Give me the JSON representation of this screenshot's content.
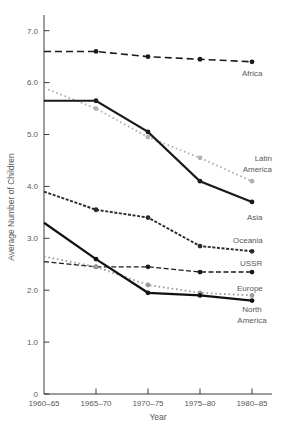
{
  "figure": {
    "background_color": "#ffffff",
    "axis_color": "#3c3c3c",
    "text_color": "#595959"
  },
  "chart_data": {
    "type": "line",
    "title": "",
    "xlabel": "Year",
    "ylabel": "Average Number of Children",
    "categories": [
      "1960–65",
      "1965–70",
      "1970–75",
      "1975–80",
      "1980–85"
    ],
    "y_ticks": [
      {
        "value": 7,
        "label": "7.0"
      },
      {
        "value": 6,
        "label": "6.0"
      },
      {
        "value": 5,
        "label": "5.0"
      },
      {
        "value": 4,
        "label": "4.0"
      },
      {
        "value": 3,
        "label": "3.0"
      },
      {
        "value": 2,
        "label": "2.0"
      },
      {
        "value": 1,
        "label": "1.0"
      },
      {
        "value": 0,
        "label": "0"
      }
    ],
    "ylim": [
      0,
      7.4
    ],
    "grid": false,
    "legend_position": "labels-at-line-ends",
    "series": [
      {
        "name": "Africa",
        "values": [
          6.6,
          6.6,
          6.5,
          6.45,
          6.4
        ],
        "color": "#1a1a1a",
        "style": "dashed",
        "label_lines": [
          "Africa"
        ]
      },
      {
        "name": "Latin America",
        "values": [
          5.9,
          5.5,
          4.95,
          4.55,
          4.1
        ],
        "color": "#b2b2b2",
        "style": "dotted",
        "label_lines": [
          "Latin",
          "America"
        ]
      },
      {
        "name": "Asia",
        "values": [
          5.65,
          5.65,
          5.05,
          4.1,
          3.7
        ],
        "color": "#1a1a1a",
        "style": "solid",
        "label_lines": [
          "Asia"
        ]
      },
      {
        "name": "Oceania",
        "values": [
          3.9,
          3.55,
          3.4,
          2.85,
          2.75
        ],
        "color": "#2a2a2a",
        "style": "short-dash",
        "label_lines": [
          "Oceania"
        ]
      },
      {
        "name": "USSR",
        "values": [
          2.55,
          2.45,
          2.45,
          2.35,
          2.35
        ],
        "color": "#1a1a1a",
        "style": "dash",
        "label_lines": [
          "USSR"
        ]
      },
      {
        "name": "Europe",
        "values": [
          2.65,
          2.45,
          2.1,
          1.95,
          1.9
        ],
        "color": "#9a9a9a",
        "style": "dotted",
        "label_lines": [
          "Europe"
        ]
      },
      {
        "name": "North America",
        "values": [
          3.3,
          2.6,
          1.95,
          1.9,
          1.8
        ],
        "color": "#111111",
        "style": "solid",
        "label_lines": [
          "North",
          "America"
        ]
      }
    ]
  }
}
